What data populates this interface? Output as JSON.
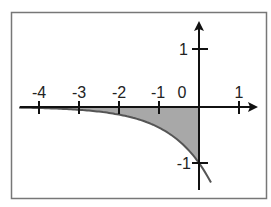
{
  "chart_data": {
    "type": "area",
    "function": "y = -e^x",
    "shaded_region": {
      "x_from": -4,
      "x_to": 0,
      "between": "curve and x-axis"
    },
    "x_ticks": [
      -4,
      -3,
      -2,
      -1,
      1
    ],
    "x_tick_labels": [
      "-4",
      "-3",
      "-2",
      "-1",
      "1"
    ],
    "y_ticks": [
      1,
      -1
    ],
    "y_tick_labels": [
      "1",
      "-1"
    ],
    "origin_label": "0",
    "xlim": [
      -4.5,
      1.4
    ],
    "ylim": [
      -1.5,
      1.25
    ],
    "grid": false,
    "colors": {
      "axis": "#111111",
      "curve": "#555555",
      "shade": "#a8a8a8",
      "frame": "#777777"
    }
  },
  "labels": {
    "xm4": "-4",
    "xm3": "-3",
    "xm2": "-2",
    "xm1": "-1",
    "x0": "0",
    "x1": "1",
    "y1": "1",
    "ym1": "-1"
  }
}
